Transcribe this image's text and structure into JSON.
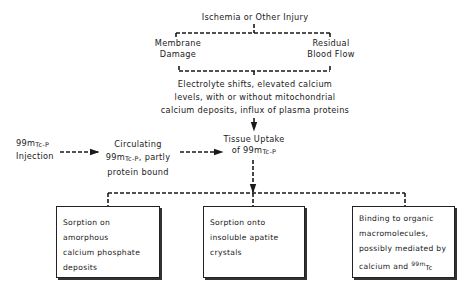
{
  "diagram": {
    "top_node": "Ischemia or Other Injury",
    "membrane_damage": [
      "Membrane",
      "Damage"
    ],
    "residual_blood_flow": [
      "Residual",
      "Blood Flow"
    ],
    "electrolyte_shifts": [
      "Electrolyte shifts, elevated calcium",
      "levels, with or without mitochondrial",
      "calcium deposits, influx of plasma proteins"
    ],
    "injection": {
      "prefix": "99m",
      "sub": "Tc-P",
      "line2": "Injection"
    },
    "circulating": {
      "line1": "Circulating",
      "prefix": "99m",
      "sub": "Tc-P",
      "suffix": ", partly",
      "line3": "protein bound"
    },
    "tissue_uptake": {
      "line1": "Tissue Uptake",
      "of": "of ",
      "prefix": "99m",
      "sub": "Tc-P"
    },
    "boxes": [
      {
        "lines": [
          "Sorption on amorphous",
          "calcium phosphate",
          "deposits"
        ]
      },
      {
        "lines": [
          "Sorption onto",
          "insoluble apatite",
          "crystals"
        ]
      },
      {
        "lines": [
          "Binding to organic",
          "macromolecules,",
          "possibly mediated by"
        ],
        "last_prefix": "calcium and ",
        "last_sup": "99m",
        "last_sub": "Tc"
      }
    ]
  },
  "colors": {
    "ink": "#1a1a1a",
    "background": "#ffffff"
  }
}
